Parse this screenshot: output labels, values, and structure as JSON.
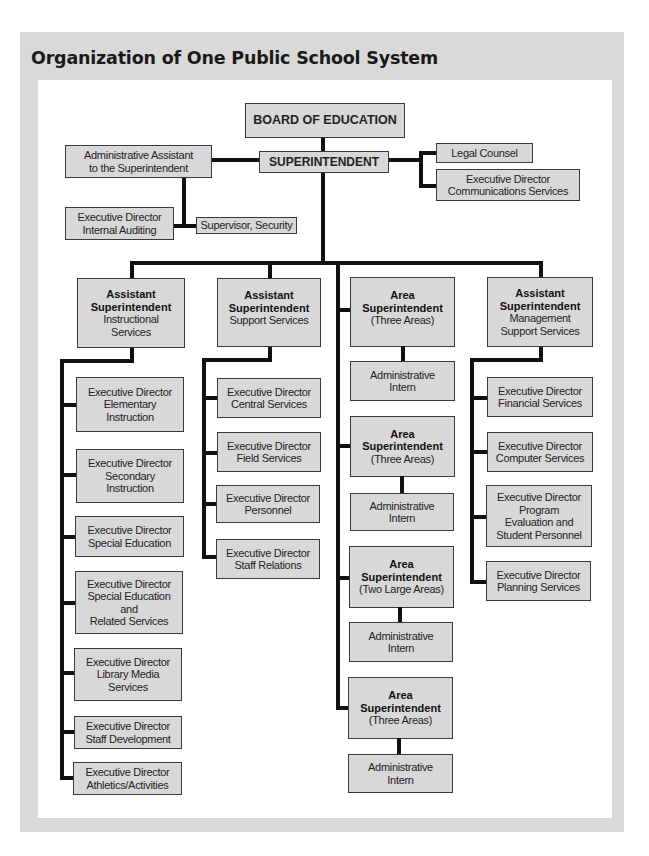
{
  "title": "Organization of One Public School System",
  "top": {
    "board": "BOARD OF EDUCATION",
    "superintendent": "SUPERINTENDENT",
    "admin_assistant": [
      "Administrative Assistant",
      "to the Superintendent"
    ],
    "internal_auditing": [
      "Executive Director",
      "Internal Auditing"
    ],
    "security": "Supervisor, Security",
    "legal": "Legal Counsel",
    "communications": [
      "Executive Director",
      "Communications Services"
    ]
  },
  "columns": [
    {
      "head": {
        "bold": [
          "Assistant",
          "Superintendent"
        ],
        "normal": [
          "Instructional",
          "Services"
        ]
      },
      "children": [
        [
          "Executive Director",
          "Elementary",
          "Instruction"
        ],
        [
          "Executive Director",
          "Secondary",
          "Instruction"
        ],
        [
          "Executive Director",
          "Special Education"
        ],
        [
          "Executive Director",
          "Special Education",
          "and",
          "Related Services"
        ],
        [
          "Executive Director",
          "Library Media",
          "Services"
        ],
        [
          "Executive Director",
          "Staff Development"
        ],
        [
          "Executive Director",
          "Athletics/Activities"
        ]
      ]
    },
    {
      "head": {
        "bold": [
          "Assistant",
          "Superintendent"
        ],
        "normal": [
          "Support Services"
        ]
      },
      "children": [
        [
          "Executive Director",
          "Central Services"
        ],
        [
          "Executive Director",
          "Field Services"
        ],
        [
          "Executive Director",
          "Personnel"
        ],
        [
          "Executive Director",
          "Staff Relations"
        ]
      ]
    },
    {
      "areas": [
        {
          "bold": [
            "Area",
            "Superintendent"
          ],
          "normal": "(Three Areas)",
          "intern": [
            "Administrative",
            "Intern"
          ]
        },
        {
          "bold": [
            "Area",
            "Superintendent"
          ],
          "normal": "(Three Areas)",
          "intern": [
            "Administrative",
            "Intern"
          ]
        },
        {
          "bold": [
            "Area",
            "Superintendent"
          ],
          "normal": "(Two Large Areas)",
          "intern": [
            "Administrative",
            "Intern"
          ]
        },
        {
          "bold": [
            "Area",
            "Superintendent"
          ],
          "normal": "(Three Areas)",
          "intern": [
            "Administrative",
            "Intern"
          ]
        }
      ]
    },
    {
      "head": {
        "bold": [
          "Assistant",
          "Superintendent"
        ],
        "normal": [
          "Management",
          "Support Services"
        ]
      },
      "children": [
        [
          "Executive Director",
          "Financial Services"
        ],
        [
          "Executive Director",
          "Computer Services"
        ],
        [
          "Executive Director",
          "Program",
          "Evaluation and",
          "Student Personnel"
        ],
        [
          "Executive Director",
          "Planning Services"
        ]
      ]
    }
  ],
  "colors": {
    "frame": "#d9d9d9",
    "box_fill": "#d8d8d8",
    "line": "#111111"
  }
}
